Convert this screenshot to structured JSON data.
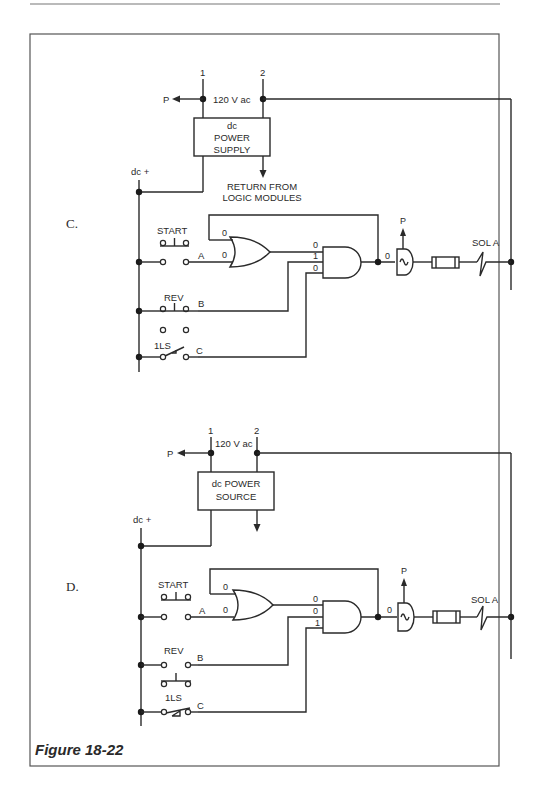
{
  "figure": {
    "caption": "Figure 18-22",
    "colors": {
      "ink": "#2a2a2a",
      "frame": "#555555",
      "background": "#ffffff"
    }
  },
  "panels": [
    {
      "letter": "C.",
      "line1_label": "1",
      "line2_label": "2",
      "supply_voltage": "120 V ac",
      "p_label": "P",
      "power_box": [
        "dc",
        "POWER",
        "SUPPLY"
      ],
      "return_label": [
        "RETURN FROM",
        "LOGIC MODULES"
      ],
      "dc_label": "dc +",
      "inputs": [
        {
          "name": "START",
          "terminal": "A",
          "type": "normally-open pushbutton"
        },
        {
          "name": "REV",
          "terminal": "B",
          "type": "normally-open pushbutton"
        },
        {
          "name": "1LS",
          "terminal": "C",
          "type": "limit switch"
        }
      ],
      "or_gate_inputs": [
        "0",
        "0"
      ],
      "and_gate_inputs": [
        "0",
        "1",
        "0"
      ],
      "amp_input": "0",
      "amp_p_label": "P",
      "output_label": "SOL A"
    },
    {
      "letter": "D.",
      "line1_label": "1",
      "line2_label": "2",
      "supply_voltage": "120 V ac",
      "p_label": "P",
      "power_box": [
        "dc POWER",
        "SOURCE"
      ],
      "dc_label": "dc +",
      "inputs": [
        {
          "name": "START",
          "terminal": "A",
          "type": "normally-open pushbutton"
        },
        {
          "name": "REV",
          "terminal": "B",
          "type": "normally-closed pushbutton"
        },
        {
          "name": "1LS",
          "terminal": "C",
          "type": "limit switch (closed)"
        }
      ],
      "or_gate_inputs": [
        "0",
        "0"
      ],
      "and_gate_inputs": [
        "0",
        "0",
        "1"
      ],
      "amp_input": "0",
      "amp_p_label": "P",
      "output_label": "SOL A"
    }
  ]
}
